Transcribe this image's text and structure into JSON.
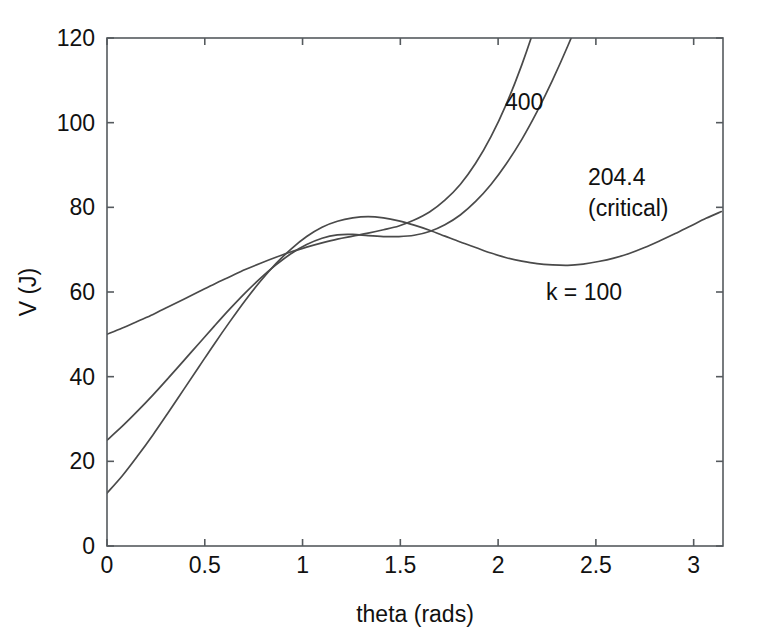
{
  "chart_data": {
    "type": "line",
    "title": "",
    "xlabel": "theta (rads)",
    "ylabel": "V (J)",
    "xlim": [
      0,
      3.15
    ],
    "ylim": [
      0,
      120
    ],
    "grid": false,
    "legend_position": "inline-annotations",
    "xticks": [
      0,
      0.5,
      1,
      1.5,
      2,
      2.5,
      3
    ],
    "xticklabels": [
      "0",
      "0.5",
      "1",
      "1.5",
      "2",
      "2.5",
      "3"
    ],
    "yticks": [
      0,
      20,
      40,
      60,
      80,
      100,
      120
    ],
    "yticklabels": [
      "0",
      "20",
      "40",
      "60",
      "80",
      "100",
      "120"
    ],
    "annotations": [
      {
        "text": "400",
        "x": 1.88,
        "y": 108.0
      },
      {
        "text": "204.4",
        "x": 2.38,
        "y": 89.0
      },
      {
        "text": "(critical)",
        "x": 2.38,
        "y": 81.5
      },
      {
        "text": "k = 100",
        "x": 2.35,
        "y": 62.0
      }
    ],
    "series": [
      {
        "name": "k = 100",
        "k": 100,
        "label": "k = 100",
        "color": "#4a4a4a",
        "x": [
          0,
          0.0785,
          0.157,
          0.2356,
          0.3142,
          0.3927,
          0.4712,
          0.5498,
          0.6283,
          0.7069,
          0.7854,
          0.8639,
          0.9425,
          1.021,
          1.0996,
          1.1781,
          1.2566,
          1.3352,
          1.4137,
          1.4923,
          1.5708,
          1.6493,
          1.7279,
          1.8064,
          1.885,
          1.9635,
          2.042,
          2.1206,
          2.1991,
          2.2777,
          2.3562,
          2.4347,
          2.5133,
          2.5918,
          2.6704,
          2.7489,
          2.8274,
          2.906,
          2.9845,
          3.0631,
          3.1416
        ],
        "y": [
          12.5,
          16.6,
          21.3,
          26.3,
          31.6,
          37.0,
          42.4,
          47.8,
          53.0,
          58.0,
          62.6,
          66.7,
          70.2,
          73.1,
          75.3,
          76.7,
          77.5,
          77.8,
          77.5,
          76.8,
          75.8,
          74.6,
          73.2,
          71.8,
          70.5,
          69.2,
          68.1,
          67.3,
          66.7,
          66.4,
          66.3,
          66.6,
          67.2,
          68.0,
          69.1,
          70.5,
          72.1,
          73.8,
          75.6,
          77.4,
          79.0
        ]
      },
      {
        "name": "204.4 (critical)",
        "k": 204.4,
        "label": "204.4",
        "sublabel": "(critical)",
        "color": "#4a4a4a",
        "x": [
          0,
          0.0785,
          0.157,
          0.2356,
          0.3142,
          0.3927,
          0.4712,
          0.5498,
          0.6283,
          0.7069,
          0.7854,
          0.8639,
          0.9425,
          1.021,
          1.0996,
          1.1781,
          1.2566,
          1.3352,
          1.4137,
          1.4923,
          1.5708,
          1.6493,
          1.7279,
          1.8064,
          1.885,
          1.9635,
          2.042,
          2.1206,
          2.1991,
          2.2777,
          2.3562,
          2.4347,
          2.5133,
          2.5918,
          2.6704,
          2.7489,
          2.8274,
          2.906,
          2.9845,
          3.0631,
          3.1416
        ],
        "y": [
          25.0,
          28.3,
          31.9,
          35.7,
          39.7,
          43.8,
          47.9,
          52.0,
          56.0,
          59.8,
          63.3,
          66.4,
          69.1,
          71.2,
          72.7,
          73.5,
          73.6,
          73.3,
          73.1,
          73.1,
          73.4,
          74.3,
          75.9,
          78.2,
          81.4,
          85.4,
          90.3,
          96.0,
          102.6,
          110.0,
          118.1,
          127.0,
          136.6,
          146.8,
          157.5,
          168.7,
          180.3,
          192.2,
          204.3,
          216.5,
          228.8
        ]
      },
      {
        "name": "400",
        "k": 400,
        "label": "400",
        "color": "#4a4a4a",
        "x": [
          0,
          0.0785,
          0.157,
          0.2356,
          0.3142,
          0.3927,
          0.4712,
          0.5498,
          0.6283,
          0.7069,
          0.7854,
          0.8639,
          0.9425,
          1.021,
          1.0996,
          1.1781,
          1.2566,
          1.3352,
          1.4137,
          1.4923,
          1.5708,
          1.6493,
          1.7279,
          1.8064,
          1.885,
          1.9635,
          2.042,
          2.1206,
          2.1991,
          2.2777,
          2.3562,
          2.4347,
          2.5133,
          2.5918,
          2.6704,
          2.7489,
          2.8274,
          2.906,
          2.9845,
          3.0631,
          3.1416
        ],
        "y": [
          50.0,
          51.5,
          53.1,
          54.7,
          56.5,
          58.3,
          60.1,
          61.9,
          63.6,
          65.3,
          66.8,
          68.2,
          69.5,
          70.6,
          71.6,
          72.5,
          73.2,
          73.9,
          74.7,
          75.6,
          77.0,
          78.9,
          81.7,
          85.4,
          90.4,
          96.7,
          104.4,
          113.6,
          124.3,
          136.5,
          150.2,
          165.3,
          181.8,
          199.5,
          218.4,
          238.4,
          259.3,
          281.0,
          303.4,
          326.3,
          349.6
        ]
      }
    ]
  },
  "axes": {
    "xlabel": "theta (rads)",
    "ylabel": "V (J)"
  },
  "ticks": {
    "x": [
      "0",
      "0.5",
      "1",
      "1.5",
      "2",
      "2.5",
      "3"
    ],
    "y": [
      "0",
      "20",
      "40",
      "60",
      "80",
      "100",
      "120"
    ]
  },
  "labels": {
    "curve_400": "400",
    "curve_critical_value": "204.4",
    "curve_critical_note": "(critical)",
    "curve_k100": "k = 100"
  }
}
